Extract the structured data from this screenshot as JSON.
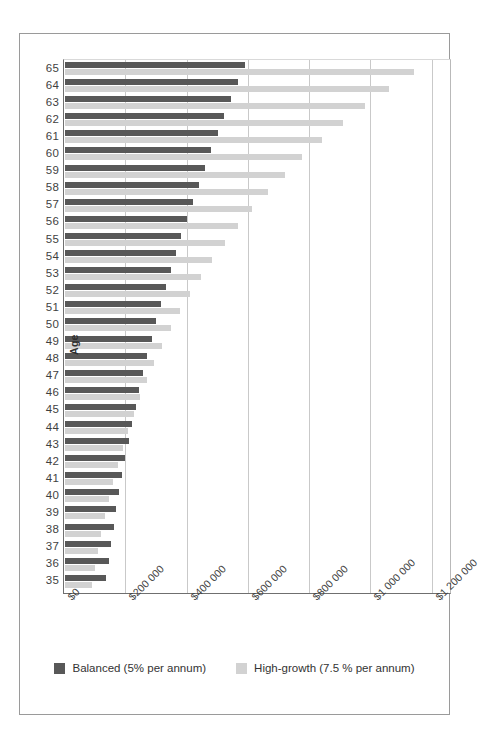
{
  "chart_data": {
    "type": "bar",
    "orientation": "horizontal",
    "title": "",
    "xlabel": "",
    "ylabel": "Age",
    "xlim": [
      0,
      1260000
    ],
    "xticks": [
      0,
      200000,
      400000,
      600000,
      800000,
      1000000,
      1200000
    ],
    "xticklabels": [
      "$0",
      "$200 000",
      "$400 000",
      "$600 000",
      "$800 000",
      "$1 000 000",
      "$1 200 000"
    ],
    "grid": true,
    "legend_position": "bottom",
    "categories": [
      65,
      64,
      63,
      62,
      61,
      60,
      59,
      58,
      57,
      56,
      55,
      54,
      53,
      52,
      51,
      50,
      49,
      48,
      47,
      46,
      45,
      44,
      43,
      42,
      41,
      40,
      39,
      38,
      37,
      36,
      35
    ],
    "series": [
      {
        "name": "Balanced (5% per annum)",
        "color": "#585858",
        "values": [
          588000,
          565000,
          542000,
          520000,
          498000,
          477000,
          456000,
          436000,
          417000,
          398000,
          380000,
          362000,
          345000,
          329000,
          313000,
          298000,
          283000,
          269000,
          256000,
          243000,
          231000,
          219000,
          208000,
          197000,
          187000,
          177000,
          168000,
          159000,
          151000,
          143000,
          135000
        ]
      },
      {
        "name": "High-growth (7.5 % per annum)",
        "color": "#d2d2d2",
        "values": [
          1139000,
          1056000,
          978000,
          906000,
          838000,
          775000,
          717000,
          663000,
          612000,
          565000,
          522000,
          481000,
          443000,
          409000,
          376000,
          346000,
          318000,
          292000,
          268000,
          246000,
          225000,
          206000,
          188000,
          172000,
          157000,
          143000,
          130000,
          118000,
          107000,
          97000,
          88000
        ]
      }
    ]
  },
  "legend": {
    "balanced_label": "Balanced (5% per annum)",
    "growth_label": "High-growth (7.5 % per annum)"
  }
}
